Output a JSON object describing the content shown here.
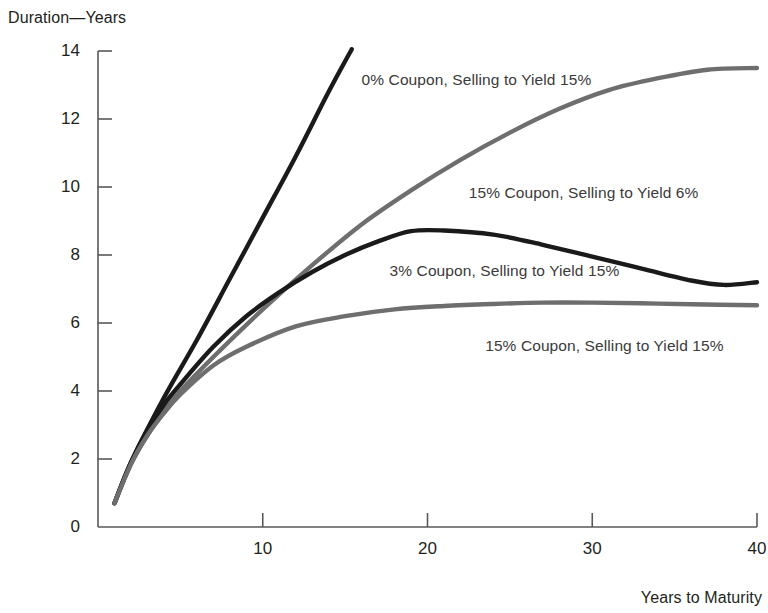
{
  "chart_data": {
    "type": "line",
    "title": "",
    "xlabel": "Years to Maturity",
    "ylabel": "Duration—Years",
    "xlim": [
      0,
      40
    ],
    "ylim": [
      0,
      14
    ],
    "grid": false,
    "legend_position": "inline annotations on curves",
    "x_ticks": [
      "10",
      "20",
      "30",
      "40"
    ],
    "x_tick_values": [
      10,
      20,
      30,
      40
    ],
    "y_ticks": [
      "0",
      "2",
      "4",
      "6",
      "8",
      "10",
      "12",
      "14"
    ],
    "y_tick_values": [
      0,
      2,
      4,
      6,
      8,
      10,
      12,
      14
    ],
    "series": [
      {
        "name": "0% Coupon, Selling to Yield 15%",
        "color": "#1a1a1a",
        "x": [
          1,
          2,
          4,
          6,
          8,
          10,
          12,
          14,
          15.4
        ],
        "values": [
          0.7,
          1.9,
          3.8,
          5.5,
          7.3,
          9.1,
          10.9,
          12.8,
          14.05
        ],
        "label_x": 16.0,
        "label_y": 13.4
      },
      {
        "name": "15% Coupon, Selling to Yield 6%",
        "color": "#6e6e6e",
        "x": [
          1,
          2,
          3,
          4,
          5,
          7,
          10,
          13,
          16,
          19,
          22,
          25,
          28,
          31,
          34,
          37,
          40
        ],
        "values": [
          0.7,
          1.85,
          2.7,
          3.4,
          4.0,
          5.0,
          6.4,
          7.7,
          8.9,
          9.9,
          10.8,
          11.6,
          12.3,
          12.85,
          13.2,
          13.45,
          13.5
        ],
        "label_x": 22.5,
        "label_y": 10.1
      },
      {
        "name": "3% Coupon, Selling to Yield 15%",
        "color": "#1a1a1a",
        "x": [
          1,
          2,
          3,
          4,
          5,
          7,
          9,
          11,
          13,
          15,
          17,
          19,
          21,
          24,
          27,
          30,
          33,
          36,
          38,
          40
        ],
        "values": [
          0.7,
          1.9,
          2.85,
          3.6,
          4.2,
          5.3,
          6.2,
          6.9,
          7.5,
          8.0,
          8.4,
          8.7,
          8.72,
          8.6,
          8.3,
          7.95,
          7.6,
          7.25,
          7.12,
          7.2
        ],
        "label_x": 17.7,
        "label_y": 7.8
      },
      {
        "name": "15% Coupon, Selling to Yield 15%",
        "color": "#6e6e6e",
        "x": [
          1,
          2,
          3,
          4,
          5,
          7,
          9,
          12,
          15,
          18,
          21,
          24,
          27,
          30,
          33,
          36,
          40
        ],
        "values": [
          0.7,
          1.85,
          2.7,
          3.35,
          3.9,
          4.75,
          5.3,
          5.9,
          6.2,
          6.4,
          6.5,
          6.56,
          6.6,
          6.6,
          6.58,
          6.55,
          6.52
        ],
        "label_x": 23.5,
        "label_y": 5.6
      }
    ]
  },
  "axes": {
    "y_title": "Duration—Years",
    "x_title": "Years to Maturity"
  }
}
